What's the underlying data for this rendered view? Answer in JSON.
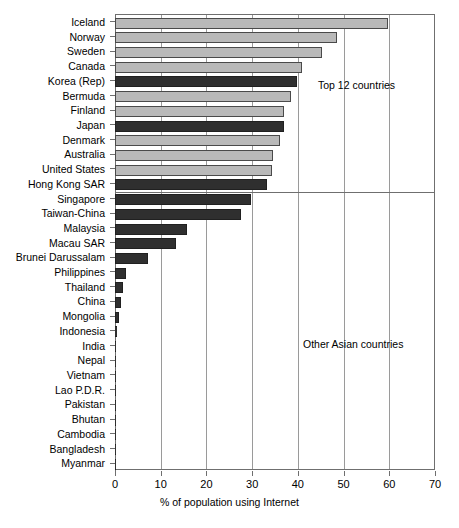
{
  "chart_data": {
    "type": "bar",
    "orientation": "horizontal",
    "title": "",
    "xlabel": "% of population using Internet",
    "ylabel": "",
    "xlim": [
      0,
      70
    ],
    "xticks": [
      0,
      10,
      20,
      30,
      40,
      50,
      60,
      70
    ],
    "grid": "vertical",
    "legend": "none",
    "categories": [
      "Iceland",
      "Norway",
      "Sweden",
      "Canada",
      "Korea (Rep)",
      "Bermuda",
      "Finland",
      "Japan",
      "Denmark",
      "Australia",
      "United States",
      "Hong Kong SAR",
      "Singapore",
      "Taiwan-China",
      "Malaysia",
      "Macau SAR",
      "Brunei Darussalam",
      "Philippines",
      "Thailand",
      "China",
      "Mongolia",
      "Indonesia",
      "India",
      "Nepal",
      "Vietnam",
      "Lao P.D.R.",
      "Pakistan",
      "Bhutan",
      "Cambodia",
      "Bangladesh",
      "Myanmar"
    ],
    "values": [
      59.8,
      48.6,
      45.2,
      40.8,
      39.9,
      38.6,
      37.0,
      37.0,
      36.2,
      34.6,
      34.3,
      33.2,
      29.8,
      27.6,
      15.8,
      13.3,
      7.3,
      2.4,
      1.8,
      1.4,
      0.8,
      0.4,
      0.3,
      0.2,
      0.2,
      0.2,
      0.2,
      0.05,
      0.05,
      0.05,
      0.0
    ],
    "bar_styles": [
      "light",
      "light",
      "light",
      "light",
      "dark",
      "light",
      "light",
      "dark",
      "light",
      "light",
      "light",
      "dark",
      "dark",
      "dark",
      "dark",
      "dark",
      "dark",
      "dark",
      "dark",
      "dark",
      "dark",
      "dark",
      "dark",
      "dark",
      "dark",
      "dark",
      "dark",
      "dark",
      "dark",
      "dark",
      "dark"
    ],
    "annotations": [
      {
        "text": "Top 12 countries",
        "group": "top-12"
      },
      {
        "text": "Other Asian countries",
        "group": "other-asian"
      }
    ],
    "group_separator_after_category": "Hong Kong SAR",
    "colors": {
      "light_bar": "#b9b9b9",
      "dark_bar": "#2f2f2f",
      "axis": "#6f6f6f",
      "gridline": "#9a9a9a",
      "background": "#ffffff"
    }
  }
}
